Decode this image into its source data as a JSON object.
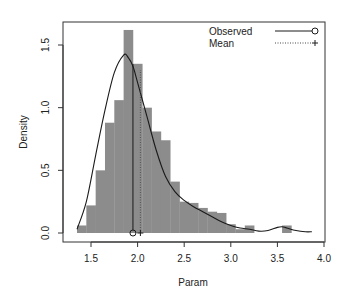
{
  "chart_data": {
    "type": "bar",
    "subtype": "histogram-with-density",
    "title": "",
    "xlabel": "Param",
    "ylabel": "Density",
    "xlim": [
      1.3,
      4.0
    ],
    "ylim": [
      0.0,
      1.65
    ],
    "x_ticks": [
      "1.5",
      "2.0",
      "2.5",
      "3.0",
      "3.5",
      "4.0"
    ],
    "x_tick_values": [
      1.5,
      2.0,
      2.5,
      3.0,
      3.5,
      4.0
    ],
    "y_ticks": [
      "0.0",
      "0.5",
      "1.0",
      "1.5"
    ],
    "y_tick_values": [
      0.0,
      0.5,
      1.0,
      1.5
    ],
    "grid": false,
    "legend_position": "top-right",
    "bin_width": 0.1,
    "bins": [
      {
        "x0": 1.35,
        "density": 0.06
      },
      {
        "x0": 1.45,
        "density": 0.22
      },
      {
        "x0": 1.55,
        "density": 0.5
      },
      {
        "x0": 1.65,
        "density": 0.88
      },
      {
        "x0": 1.75,
        "density": 1.06
      },
      {
        "x0": 1.85,
        "density": 1.62
      },
      {
        "x0": 1.95,
        "density": 1.35
      },
      {
        "x0": 2.05,
        "density": 1.0
      },
      {
        "x0": 2.15,
        "density": 0.81
      },
      {
        "x0": 2.25,
        "density": 0.74
      },
      {
        "x0": 2.35,
        "density": 0.41
      },
      {
        "x0": 2.45,
        "density": 0.25
      },
      {
        "x0": 2.55,
        "density": 0.24
      },
      {
        "x0": 2.65,
        "density": 0.2
      },
      {
        "x0": 2.75,
        "density": 0.17
      },
      {
        "x0": 2.85,
        "density": 0.16
      },
      {
        "x0": 2.95,
        "density": 0.07
      },
      {
        "x0": 3.05,
        "density": 0.03
      },
      {
        "x0": 3.15,
        "density": 0.06
      },
      {
        "x0": 3.25,
        "density": 0.0
      },
      {
        "x0": 3.35,
        "density": 0.0
      },
      {
        "x0": 3.45,
        "density": 0.0
      },
      {
        "x0": 3.55,
        "density": 0.06
      }
    ],
    "density_curve": {
      "x": [
        1.35,
        1.45,
        1.55,
        1.65,
        1.75,
        1.85,
        1.9,
        1.95,
        2.0,
        2.1,
        2.2,
        2.3,
        2.4,
        2.5,
        2.6,
        2.7,
        2.8,
        2.9,
        3.0,
        3.1,
        3.2,
        3.3,
        3.4,
        3.5,
        3.55,
        3.6,
        3.7,
        3.8,
        3.87
      ],
      "y": [
        0.03,
        0.25,
        0.62,
        0.98,
        1.28,
        1.42,
        1.4,
        1.33,
        1.2,
        0.93,
        0.66,
        0.45,
        0.33,
        0.26,
        0.21,
        0.17,
        0.13,
        0.09,
        0.06,
        0.04,
        0.03,
        0.015,
        0.02,
        0.045,
        0.05,
        0.04,
        0.02,
        0.01,
        0.01
      ]
    },
    "series": [
      {
        "name": "Observed",
        "value": 1.95,
        "line_style": "solid",
        "marker": "circle"
      },
      {
        "name": "Mean",
        "value": 2.03,
        "line_style": "dotted",
        "marker": "plus"
      }
    ],
    "colors": {
      "bar_fill": "#8c8c8c",
      "curve": "#1a1a1a",
      "axis": "#333333"
    }
  }
}
